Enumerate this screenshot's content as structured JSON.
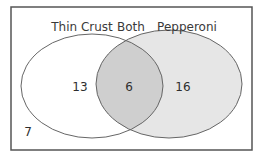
{
  "diagram": {
    "type": "venn",
    "sets": [
      {
        "name": "Thin Crust",
        "only_count": "13",
        "fill": "#ffffff"
      },
      {
        "name": "Pepperoni",
        "only_count": "16",
        "fill": "#e6e6e6"
      }
    ],
    "intersection": {
      "label": "Both",
      "count": "6",
      "fill": "#cfcfcf"
    },
    "outside": {
      "count": "7"
    },
    "labels": {
      "left": "Thin Crust",
      "middle": "Both",
      "right": "Pepperoni"
    },
    "counts": {
      "left_only": "13",
      "both": "6",
      "right_only": "16",
      "neither": "7"
    },
    "colors": {
      "border": "#555555",
      "outline": "#666666",
      "left_fill": "#ffffff",
      "right_fill": "#e6e6e6",
      "overlap_fill": "#cfcfcf"
    }
  }
}
